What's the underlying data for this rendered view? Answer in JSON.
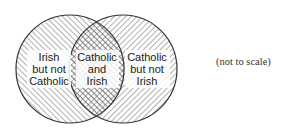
{
  "diagram": {
    "type": "venn",
    "sets": [
      {
        "name": "Irish",
        "center": [
          70,
          69
        ],
        "radius": 54
      },
      {
        "name": "Catholic",
        "center": [
          123,
          69
        ],
        "radius": 54
      }
    ],
    "regions": {
      "left_only": [
        "Irish",
        "but not",
        "Catholic"
      ],
      "intersection": [
        "Catholic",
        "and",
        "Irish"
      ],
      "right_only": [
        "Catholic",
        "but not",
        "Irish"
      ]
    },
    "note": "(not to scale)",
    "colors": {
      "stroke": "#333333",
      "hatch": "#555555",
      "background": "#ffffff"
    }
  }
}
